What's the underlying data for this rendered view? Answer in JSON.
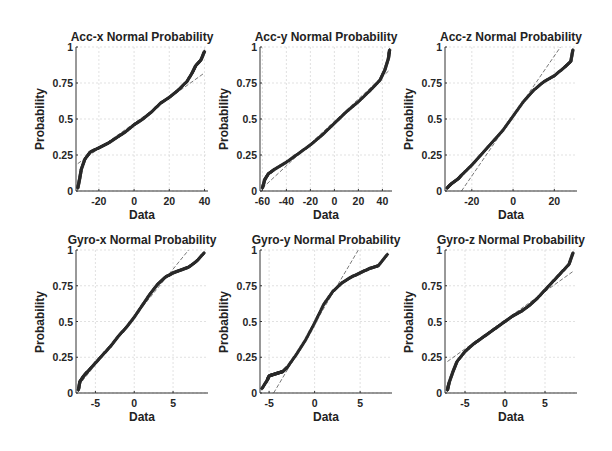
{
  "chart_data": [
    {
      "type": "scatter",
      "subtype": "normal-probability-plot",
      "title": "Acc-x Normal Probability",
      "xlabel": "Data",
      "ylabel": "Probability",
      "xlim": [
        -33,
        42
      ],
      "ylim": [
        0,
        1
      ],
      "xticks": [
        -20,
        0,
        20,
        40
      ],
      "yticks": [
        0,
        0.25,
        0.5,
        0.75,
        1
      ],
      "ytick_labels": [
        "0",
        "0.25",
        "0.5",
        "0.75",
        "1"
      ],
      "grid": true,
      "reference_line": {
        "x": [
          -32,
          40
        ],
        "y": [
          0.19,
          0.82
        ]
      },
      "series": [
        {
          "name": "data",
          "x": [
            -32,
            -31,
            -30,
            -28,
            -25,
            -20,
            -15,
            -10,
            -5,
            0,
            5,
            10,
            15,
            20,
            25,
            30,
            33,
            35,
            38,
            40
          ],
          "y": [
            0.02,
            0.08,
            0.15,
            0.22,
            0.27,
            0.3,
            0.33,
            0.37,
            0.41,
            0.46,
            0.5,
            0.55,
            0.61,
            0.65,
            0.7,
            0.76,
            0.82,
            0.87,
            0.91,
            0.97
          ]
        }
      ]
    },
    {
      "type": "scatter",
      "subtype": "normal-probability-plot",
      "title": "Acc-y Normal Probability",
      "xlabel": "Data",
      "ylabel": "Probability",
      "xlim": [
        -62,
        48
      ],
      "ylim": [
        0,
        1
      ],
      "xticks": [
        -60,
        -40,
        -20,
        0,
        20,
        40
      ],
      "yticks": [
        0,
        0.25,
        0.5,
        0.75,
        1
      ],
      "ytick_labels": [
        "0",
        "0.25",
        "0.5",
        "0.75",
        "1"
      ],
      "grid": true,
      "reference_line": {
        "x": [
          -60,
          46
        ],
        "y": [
          0.02,
          0.84
        ]
      },
      "series": [
        {
          "name": "data",
          "x": [
            -60,
            -58,
            -55,
            -50,
            -40,
            -30,
            -20,
            -10,
            0,
            10,
            20,
            30,
            38,
            42,
            45,
            46
          ],
          "y": [
            0.02,
            0.08,
            0.12,
            0.15,
            0.2,
            0.26,
            0.32,
            0.39,
            0.47,
            0.55,
            0.62,
            0.7,
            0.77,
            0.84,
            0.92,
            0.98
          ]
        }
      ]
    },
    {
      "type": "scatter",
      "subtype": "normal-probability-plot",
      "title": "Acc-z Normal Probability",
      "xlabel": "Data",
      "ylabel": "Probability",
      "xlim": [
        -33,
        31
      ],
      "ylim": [
        0,
        1
      ],
      "xticks": [
        -20,
        0,
        20
      ],
      "yticks": [
        0,
        0.25,
        0.5,
        0.75,
        1
      ],
      "ytick_labels": [
        "0",
        "0.25",
        "0.5",
        "0.75",
        "1"
      ],
      "grid": true,
      "reference_line": {
        "x": [
          -25,
          23
        ],
        "y": [
          0.0,
          1.0
        ]
      },
      "series": [
        {
          "name": "data",
          "x": [
            -32,
            -30,
            -27,
            -25,
            -20,
            -15,
            -10,
            -5,
            0,
            5,
            10,
            15,
            20,
            25,
            28,
            29
          ],
          "y": [
            0.02,
            0.05,
            0.08,
            0.11,
            0.18,
            0.26,
            0.34,
            0.42,
            0.52,
            0.62,
            0.7,
            0.76,
            0.8,
            0.86,
            0.9,
            0.98
          ]
        }
      ]
    },
    {
      "type": "scatter",
      "subtype": "normal-probability-plot",
      "title": "Gyro-x Normal Probability",
      "xlabel": "Data",
      "ylabel": "Probability",
      "xlim": [
        -7.5,
        9.5
      ],
      "ylim": [
        0,
        1
      ],
      "xticks": [
        -5,
        0,
        5
      ],
      "yticks": [
        0,
        0.25,
        0.5,
        0.75,
        1
      ],
      "ytick_labels": [
        "0",
        "0.25",
        "0.5",
        "0.75",
        "1"
      ],
      "grid": true,
      "reference_line": {
        "x": [
          -7.2,
          7
        ],
        "y": [
          0.05,
          1.0
        ]
      },
      "series": [
        {
          "name": "data",
          "x": [
            -7.2,
            -7,
            -6.5,
            -6,
            -5,
            -4,
            -3,
            -2,
            -1,
            0,
            1,
            2,
            3,
            4,
            5,
            6,
            7,
            8,
            9
          ],
          "y": [
            0.02,
            0.08,
            0.12,
            0.15,
            0.21,
            0.27,
            0.33,
            0.4,
            0.46,
            0.53,
            0.61,
            0.69,
            0.76,
            0.81,
            0.84,
            0.86,
            0.88,
            0.92,
            0.98
          ]
        }
      ]
    },
    {
      "type": "scatter",
      "subtype": "normal-probability-plot",
      "title": "Gyro-y Normal Probability",
      "xlabel": "Data",
      "ylabel": "Probability",
      "xlim": [
        -6,
        8.5
      ],
      "ylim": [
        0,
        1
      ],
      "xticks": [
        -5,
        0,
        5
      ],
      "yticks": [
        0,
        0.25,
        0.5,
        0.75,
        1
      ],
      "ytick_labels": [
        "0",
        "0.25",
        "0.5",
        "0.75",
        "1"
      ],
      "grid": true,
      "reference_line": {
        "x": [
          -4.5,
          4.8
        ],
        "y": [
          0.0,
          1.0
        ]
      },
      "series": [
        {
          "name": "data",
          "x": [
            -5.8,
            -5.2,
            -5,
            -4.5,
            -4,
            -3.5,
            -3,
            -2,
            -1,
            0,
            1,
            2,
            3,
            4,
            5,
            6,
            7,
            8
          ],
          "y": [
            0.03,
            0.09,
            0.12,
            0.13,
            0.14,
            0.15,
            0.18,
            0.27,
            0.37,
            0.49,
            0.62,
            0.71,
            0.77,
            0.81,
            0.84,
            0.87,
            0.89,
            0.97
          ]
        }
      ]
    },
    {
      "type": "scatter",
      "subtype": "normal-probability-plot",
      "title": "Gyro-z Normal Probability",
      "xlabel": "Data",
      "ylabel": "Probability",
      "xlim": [
        -7.5,
        9
      ],
      "ylim": [
        0,
        1
      ],
      "xticks": [
        -5,
        0,
        5
      ],
      "yticks": [
        0,
        0.25,
        0.5,
        0.75,
        1
      ],
      "ytick_labels": [
        "0",
        "0.25",
        "0.5",
        "0.75",
        "1"
      ],
      "grid": true,
      "reference_line": {
        "x": [
          -7.2,
          8.5
        ],
        "y": [
          0.22,
          0.85
        ]
      },
      "series": [
        {
          "name": "data",
          "x": [
            -7.2,
            -7,
            -6.5,
            -6,
            -5,
            -4,
            -3,
            -2,
            -1,
            0,
            1,
            2,
            3,
            4,
            5,
            6,
            7,
            8,
            8.5
          ],
          "y": [
            0.02,
            0.07,
            0.15,
            0.22,
            0.29,
            0.34,
            0.38,
            0.42,
            0.46,
            0.5,
            0.54,
            0.57,
            0.61,
            0.66,
            0.72,
            0.78,
            0.84,
            0.9,
            0.98
          ]
        }
      ]
    }
  ],
  "layout": {
    "subplots": [
      {
        "left": 76,
        "top": 47,
        "width": 132,
        "height": 144
      },
      {
        "left": 260,
        "top": 47,
        "width": 132,
        "height": 144
      },
      {
        "left": 445,
        "top": 47,
        "width": 132,
        "height": 144
      },
      {
        "left": 76,
        "top": 250,
        "width": 132,
        "height": 143
      },
      {
        "left": 260,
        "top": 250,
        "width": 132,
        "height": 143
      },
      {
        "left": 445,
        "top": 250,
        "width": 132,
        "height": 143
      }
    ],
    "colors": {
      "marker": "#2a2a2a",
      "grid": "#d9d9d9",
      "axis": "#333333",
      "refline": "#555555"
    }
  }
}
